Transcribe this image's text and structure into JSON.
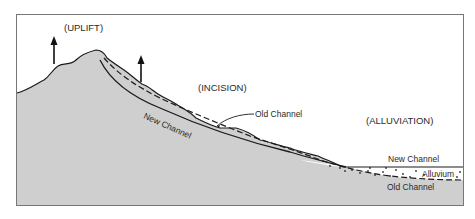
{
  "diagram": {
    "labels": {
      "uplift": "(UPLIFT)",
      "incision": "(INCISION)",
      "alluviation": "(ALLUVIATION)",
      "old_channel_upper": "Old Channel",
      "new_channel_slope": "New Channel",
      "new_channel_right": "New Channel",
      "alluvium": "Alluvium",
      "old_channel_lower": "Old Channel"
    },
    "colors": {
      "terrain_fill": "#cfcfcf",
      "outline": "#1a1a1a",
      "frame": "#777777",
      "background": "#ffffff"
    },
    "arrows": [
      {
        "name": "uplift-arrow-left",
        "direction": "up"
      },
      {
        "name": "uplift-arrow-right",
        "direction": "up"
      }
    ]
  }
}
